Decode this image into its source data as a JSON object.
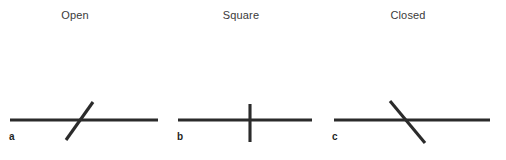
{
  "figure": {
    "background_color": "#ffffff",
    "stroke_color": "#2b2b2b",
    "title_color": "#3a3a3a",
    "letter_color": "#1f1f1f"
  },
  "panels": [
    {
      "letter": "a",
      "title": "Open",
      "intersection_type": "open",
      "horizontal_line": {
        "x1": 10,
        "y1": 120,
        "x2": 158,
        "y2": 120
      },
      "crossing_line": {
        "x1": 66,
        "y1": 140,
        "x2": 93,
        "y2": 102
      },
      "crossing_angle_deg": 55
    },
    {
      "letter": "b",
      "title": "Square",
      "intersection_type": "square",
      "horizontal_line": {
        "x1": 10,
        "y1": 120,
        "x2": 144,
        "y2": 120
      },
      "crossing_line": {
        "x1": 82,
        "y1": 104,
        "x2": 82,
        "y2": 142
      },
      "crossing_angle_deg": 90
    },
    {
      "letter": "c",
      "title": "Closed",
      "intersection_type": "closed",
      "horizontal_line": {
        "x1": 4,
        "y1": 120,
        "x2": 160,
        "y2": 120
      },
      "crossing_line": {
        "x1": 60,
        "y1": 101,
        "x2": 95,
        "y2": 143
      },
      "crossing_angle_deg": -50
    }
  ]
}
